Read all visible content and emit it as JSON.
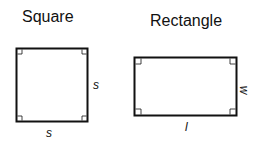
{
  "shapes": [
    {
      "name": "Square",
      "side_label_right": "s",
      "side_label_bottom": "s"
    },
    {
      "name": "Rectangle",
      "side_label_right": "w",
      "side_label_bottom": "l"
    }
  ],
  "colors": {
    "stroke": "#111111",
    "background": "#ffffff"
  }
}
